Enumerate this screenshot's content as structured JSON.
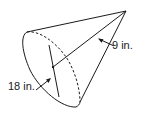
{
  "figure": {
    "type": "cone",
    "stroke_color": "#1a1a1a",
    "background": "#ffffff"
  },
  "labels": {
    "slant_height": "9 in.",
    "radius": "18 in."
  },
  "dimensions": {
    "slant_height": {
      "value": 9,
      "unit": "in."
    },
    "radius": {
      "value": 18,
      "unit": "in."
    }
  }
}
